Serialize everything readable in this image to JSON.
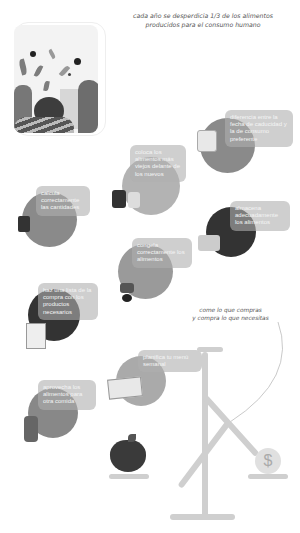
{
  "headline": {
    "line1": "cada año se desperdicia 1/3 de los alimentos",
    "line2": "producidos para el consumo humano"
  },
  "steps": [
    {
      "id": "diferenciar-fechas",
      "text": "diferencia entre la fecha de caducidad y la de consumo preferente",
      "icon": "yogurt-cup-icon"
    },
    {
      "id": "colocar-alimentos",
      "text": "coloca los alimentos más viejos delante de los nuevos",
      "icon": "jar-icon"
    },
    {
      "id": "calcular-cantidades",
      "text": "calcula correctamente las cantidades",
      "icon": "pot-icon"
    },
    {
      "id": "almacenar",
      "text": "almacena adecuadamente los alimentos",
      "icon": "fridge-icon"
    },
    {
      "id": "congelar",
      "text": "congela correctamente los alimentos",
      "icon": "freezer-bag-icon"
    },
    {
      "id": "lista-compra",
      "text": "haz una lista de la compra con los productos necesarios",
      "icon": "shopping-list-icon"
    },
    {
      "id": "planificar-menu",
      "text": "planifica tu menú semanal",
      "icon": "menu-planner-icon"
    },
    {
      "id": "aprovechar",
      "text": "aprovecha los alimentos para otra comida",
      "icon": "leftovers-icon"
    }
  ],
  "callout": {
    "line1": "come lo que compras",
    "line2": "y compra lo que necesitas"
  },
  "scale": {
    "left_item": "apple-icon",
    "right_item": "dollar-coin-icon",
    "coin_symbol": "$"
  },
  "colors": {
    "label_bg": "#afafaf",
    "circle_dark": "#3a3a3a",
    "circle_mid": "#8a8a8a",
    "circle_light": "#b5b5b5",
    "scale": "#cfcfcf"
  }
}
